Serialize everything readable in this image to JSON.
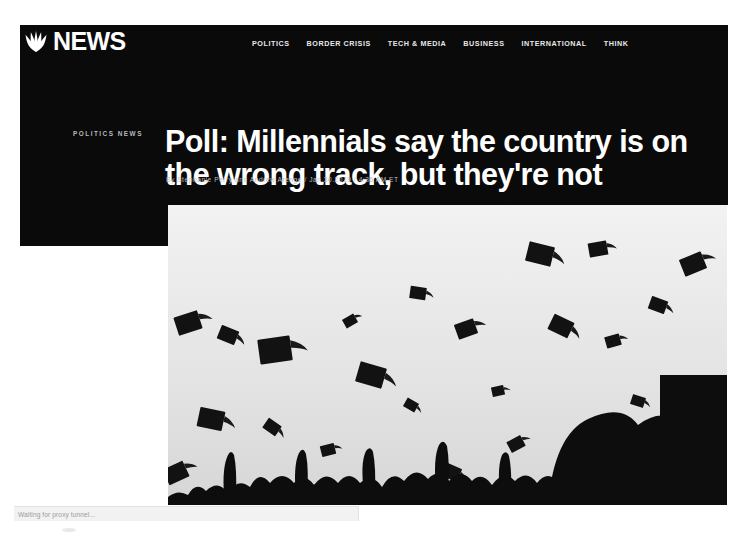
{
  "site": {
    "brand_word": "NEWS",
    "logo_icon": "nbc-peacock-icon"
  },
  "nav": {
    "items": [
      {
        "label": "POLITICS"
      },
      {
        "label": "BORDER CRISIS"
      },
      {
        "label": "TECH & MEDIA"
      },
      {
        "label": "BUSINESS"
      },
      {
        "label": "INTERNATIONAL"
      },
      {
        "label": "THINK"
      }
    ]
  },
  "article": {
    "kicker": "POLITICS NEWS",
    "headline": "Poll: Millennials say the country is on the wrong track, but they're not",
    "byline": "By Stephanie Perry and Andrew Arenge / Jan.30.2019 / 4:36 AM ET",
    "hero_image_alt": "graduation-caps-thrown-in-air-photo"
  },
  "browser": {
    "status_text": "Waiting for proxy tunnel..."
  },
  "colors": {
    "background": "#0a0a0a",
    "text_primary": "#ffffff",
    "text_muted": "#bdbdbd",
    "page": "#ffffff",
    "status_bar": "#f2f2f2"
  }
}
